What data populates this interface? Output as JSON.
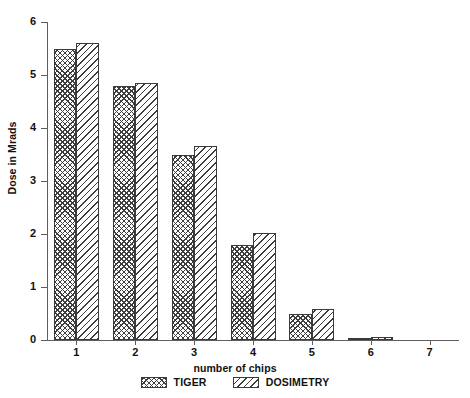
{
  "chart_data": {
    "type": "bar",
    "title": "",
    "xlabel": "number of chips",
    "ylabel": "Dose in Mrads",
    "categories": [
      "1",
      "2",
      "3",
      "4",
      "5",
      "6",
      "7"
    ],
    "x_tick_labels": [
      "1",
      "2",
      "3",
      "4",
      "5",
      "6",
      "7"
    ],
    "y_tick_labels": [
      "0",
      "1",
      "2",
      "3",
      "4",
      "5",
      "6"
    ],
    "ylim": [
      0,
      6
    ],
    "xlim": [
      0.5,
      7.5
    ],
    "grid": false,
    "legend_position": "bottom-center",
    "series": [
      {
        "name": "TIGER",
        "pattern": "cross-hatch",
        "color": "#3d3d3d",
        "values": [
          5.5,
          4.8,
          3.5,
          1.8,
          0.5,
          0.04,
          0
        ]
      },
      {
        "name": "DOSIMETRY",
        "pattern": "diagonal-stripes",
        "color": "#3d3d3d",
        "values": [
          5.6,
          4.85,
          3.67,
          2.02,
          0.58,
          0.05,
          0
        ]
      }
    ],
    "legend": [
      "TIGER",
      "DOSIMETRY"
    ],
    "axis_color": "#5e5e5e",
    "background": "#ffffff"
  }
}
